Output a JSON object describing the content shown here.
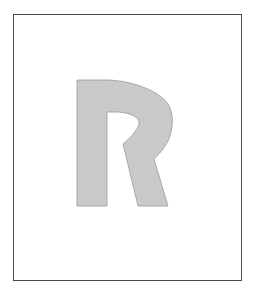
{
  "figure": {
    "letter": "R",
    "frame_color": "#4a4a4a",
    "frame_background": "#ffffff",
    "glyph_fill": "#c9c9c9",
    "glyph_outline": "#9a9a9a"
  }
}
